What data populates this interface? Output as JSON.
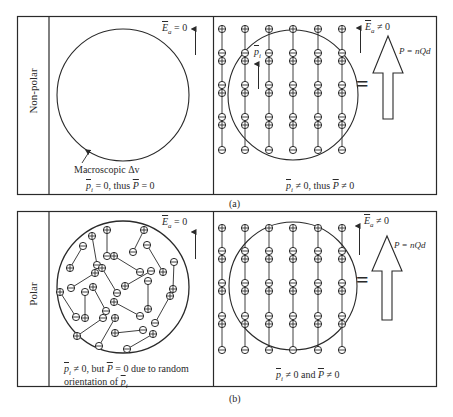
{
  "panels": {
    "a": {
      "caption": "(a)",
      "row_label": "Non-polar",
      "left": {
        "field_label_sym": "E",
        "field_label_sub": "a",
        "field_label_rel": "= 0",
        "volume_label": "Macroscopic Δv",
        "result": {
          "p_sym": "p",
          "p_sub": "i",
          "mid": " = 0, thus ",
          "P_sym": "P",
          "end": " = 0"
        }
      },
      "right": {
        "field_label_sym": "E",
        "field_label_sub": "a",
        "field_label_rel": "≠ 0",
        "dipole_label_sym": "p",
        "dipole_label_sub": "i",
        "equals": "=",
        "polarization": "P = nQd",
        "result": {
          "p_sym": "p",
          "p_sub": "i",
          "mid": " ≠ 0, thus ",
          "P_sym": "P",
          "end": " ≠ 0"
        }
      }
    },
    "b": {
      "caption": "(b)",
      "row_label": "Polar",
      "left": {
        "field_label_sym": "E",
        "field_label_sub": "a",
        "field_label_rel": "= 0",
        "result_line1": {
          "p_sym": "p",
          "p_sub": "i",
          "mid": " ≠ 0, but ",
          "P_sym": "P",
          "end": " = 0 due to random"
        },
        "result_line2": {
          "pre": "orientation of ",
          "p_sym": "p",
          "p_sub": "i"
        }
      },
      "right": {
        "field_label_sym": "E",
        "field_label_sub": "a",
        "field_label_rel": "≠ 0",
        "equals": "=",
        "polarization": "P = nQd",
        "result": {
          "p_sym": "p",
          "p_sub": "i",
          "mid": " ≠ 0 and ",
          "P_sym": "P",
          "end": " ≠ 0"
        }
      }
    }
  },
  "charges": {
    "positive": "⊕",
    "negative": "⊖"
  },
  "colors": {
    "ink": "#2a2a2a",
    "background": "#ffffff"
  }
}
